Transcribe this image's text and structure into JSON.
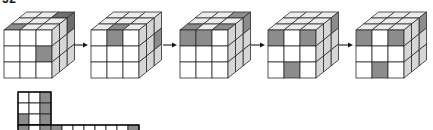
{
  "figure": {
    "caption": "52",
    "background_color": "#ffffff",
    "stroke_color": "#2b2b2b",
    "colors": {
      "white": "#ffffff",
      "light_gray": "#f2f2f2",
      "mid_gray": "#9a9a9a",
      "shade_gray": "#8c8c8c",
      "dark_gray": "#6e6e6e",
      "side_gray": "#d6d6d6",
      "top_gray": "#ececec"
    },
    "cube_count": 5,
    "grid_size": 3,
    "arrow_count": 4,
    "arrow_glyph": "right-arrow"
  },
  "cubes": [
    {
      "index": 1,
      "label": "cube-1",
      "origin": {
        "x": 4,
        "y": 12
      },
      "top_face": [
        [
          "white",
          "white",
          "dark_gray"
        ],
        [
          "white",
          "white",
          "white"
        ],
        [
          "shade_gray",
          "white",
          "white"
        ]
      ],
      "front_face": [
        [
          "white",
          "white",
          "white"
        ],
        [
          "white",
          "white",
          "shade_gray"
        ],
        [
          "white",
          "white",
          "white"
        ]
      ],
      "side_face": [
        [
          "dark_gray",
          "side_gray",
          "side_gray"
        ],
        [
          "side_gray",
          "side_gray",
          "side_gray"
        ],
        [
          "side_gray",
          "side_gray",
          "side_gray"
        ]
      ]
    },
    {
      "index": 2,
      "label": "cube-2",
      "origin": {
        "x": 91,
        "y": 12
      },
      "top_face": [
        [
          "white",
          "white",
          "white"
        ],
        [
          "white",
          "white",
          "white"
        ],
        [
          "white",
          "shade_gray",
          "white"
        ]
      ],
      "front_face": [
        [
          "white",
          "shade_gray",
          "white"
        ],
        [
          "white",
          "white",
          "white"
        ],
        [
          "white",
          "white",
          "white"
        ]
      ],
      "side_face": [
        [
          "side_gray",
          "side_gray",
          "side_gray"
        ],
        [
          "shade_gray",
          "side_gray",
          "side_gray"
        ],
        [
          "side_gray",
          "side_gray",
          "side_gray"
        ]
      ]
    },
    {
      "index": 3,
      "label": "cube-3",
      "origin": {
        "x": 180,
        "y": 12
      },
      "top_face": [
        [
          "white",
          "white",
          "shade_gray"
        ],
        [
          "white",
          "white",
          "white"
        ],
        [
          "shade_gray",
          "white",
          "shade_gray"
        ]
      ],
      "front_face": [
        [
          "shade_gray",
          "shade_gray",
          "white"
        ],
        [
          "white",
          "white",
          "white"
        ],
        [
          "white",
          "white",
          "white"
        ]
      ],
      "side_face": [
        [
          "shade_gray",
          "side_gray",
          "side_gray"
        ],
        [
          "side_gray",
          "side_gray",
          "side_gray"
        ],
        [
          "side_gray",
          "side_gray",
          "side_gray"
        ]
      ]
    },
    {
      "index": 4,
      "label": "cube-4",
      "origin": {
        "x": 268,
        "y": 12
      },
      "top_face": [
        [
          "white",
          "white",
          "white"
        ],
        [
          "white",
          "white",
          "white"
        ],
        [
          "white",
          "white",
          "white"
        ]
      ],
      "front_face": [
        [
          "shade_gray",
          "white",
          "shade_gray"
        ],
        [
          "white",
          "white",
          "white"
        ],
        [
          "white",
          "shade_gray",
          "white"
        ]
      ],
      "side_face": [
        [
          "shade_gray",
          "side_gray",
          "side_gray"
        ],
        [
          "side_gray",
          "side_gray",
          "side_gray"
        ],
        [
          "side_gray",
          "side_gray",
          "side_gray"
        ]
      ]
    },
    {
      "index": 5,
      "label": "cube-5",
      "origin": {
        "x": 356,
        "y": 12
      },
      "top_face": [
        [
          "white",
          "white",
          "white"
        ],
        [
          "white",
          "white",
          "white"
        ],
        [
          "white",
          "white",
          "white"
        ]
      ],
      "front_face": [
        [
          "shade_gray",
          "white",
          "shade_gray"
        ],
        [
          "white",
          "white",
          "white"
        ],
        [
          "white",
          "shade_gray",
          "white"
        ]
      ],
      "side_face": [
        [
          "shade_gray",
          "side_gray",
          "side_gray"
        ],
        [
          "side_gray",
          "side_gray",
          "side_gray"
        ],
        [
          "side_gray",
          "side_gray",
          "side_gray"
        ]
      ]
    }
  ],
  "arrows": [
    {
      "label": "arrow-1",
      "x": 74,
      "y": 45
    },
    {
      "label": "arrow-2",
      "x": 163,
      "y": 45
    },
    {
      "label": "arrow-3",
      "x": 251,
      "y": 45
    },
    {
      "label": "arrow-4",
      "x": 339,
      "y": 45
    }
  ],
  "net": {
    "label": "cube-net-strip",
    "cell_size": 11,
    "block_origin": {
      "x": 18,
      "y": 92
    },
    "block_rows": 3,
    "block_cols": 3,
    "block_cells": [
      [
        "white",
        "white",
        "shade_gray"
      ],
      [
        "white",
        "white",
        "shade_gray"
      ],
      [
        "shade_gray",
        "white",
        "shade_gray"
      ]
    ],
    "strip_origin": {
      "x": 18,
      "y": 125
    },
    "strip_cols": 11,
    "strip_cells": [
      "shade_gray",
      "white",
      "shade_gray",
      "shade_gray",
      "white",
      "white",
      "white",
      "white",
      "white",
      "white",
      "shade_gray"
    ]
  }
}
